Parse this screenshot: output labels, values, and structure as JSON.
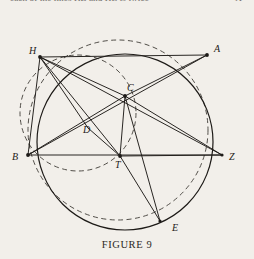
{
  "page": {
    "background_color": "#f2efea",
    "ink_color": "#1d1a17",
    "top_running_text": "each of the lines HZ and HE is twice",
    "top_running_text_right": "A",
    "caption": "FIGURE 9"
  },
  "figure": {
    "name": "figure-9",
    "title": "FIGURE 9",
    "labels": {
      "A": "A",
      "B": "B",
      "C": "C",
      "D": "D",
      "E": "E",
      "H": "H",
      "T": "T",
      "Z": "Z"
    },
    "points": [
      {
        "id": "H",
        "label": "H",
        "x": 40,
        "y": 57,
        "label_x": 29,
        "label_y": 54
      },
      {
        "id": "A",
        "label": "A",
        "x": 207,
        "y": 55,
        "label_x": 214,
        "label_y": 52
      },
      {
        "id": "C",
        "label": "C",
        "x": 125,
        "y": 96,
        "label_x": 127,
        "label_y": 91
      },
      {
        "id": "D",
        "label": "D",
        "x": 88,
        "y": 128,
        "label_x": 85,
        "label_y": 133
      },
      {
        "id": "B",
        "label": "B",
        "x": 28,
        "y": 155,
        "label_x": 14,
        "label_y": 159
      },
      {
        "id": "T",
        "label": "T",
        "x": 120,
        "y": 156,
        "label_x": 114,
        "label_y": 167
      },
      {
        "id": "Z",
        "label": "Z",
        "x": 222,
        "y": 155,
        "label_x": 228,
        "label_y": 159
      },
      {
        "id": "E",
        "label": "E",
        "x": 160,
        "y": 221,
        "label_x": 174,
        "label_y": 230
      }
    ],
    "circles": [
      {
        "id": "main-circle",
        "style": "solid",
        "cx": 125,
        "cy": 142,
        "r": 88
      },
      {
        "id": "dashed-circle-1",
        "style": "dashed",
        "cx": 118,
        "cy": 130,
        "r": 90
      },
      {
        "id": "dashed-circle-2",
        "style": "dashed",
        "cx": 78,
        "cy": 113,
        "r": 58
      }
    ],
    "segments": [
      {
        "from": "H",
        "to": "A",
        "style": "solid"
      },
      {
        "from": "H",
        "to": "B",
        "style": "solid"
      },
      {
        "from": "H",
        "to": "C",
        "style": "solid"
      },
      {
        "from": "H",
        "to": "D",
        "style": "solid"
      },
      {
        "from": "H",
        "to": "T",
        "style": "solid"
      },
      {
        "from": "H",
        "to": "Z",
        "style": "solid"
      },
      {
        "from": "B",
        "to": "Z",
        "style": "solid"
      },
      {
        "from": "B",
        "to": "A",
        "style": "solid"
      },
      {
        "from": "B",
        "to": "C",
        "style": "solid"
      },
      {
        "from": "A",
        "to": "C",
        "style": "solid"
      },
      {
        "from": "C",
        "to": "Z",
        "style": "solid"
      },
      {
        "from": "C",
        "to": "T",
        "style": "solid"
      },
      {
        "from": "C",
        "to": "E",
        "style": "solid"
      },
      {
        "from": "T",
        "to": "Z",
        "style": "solid"
      },
      {
        "from": "T",
        "to": "E",
        "style": "solid"
      },
      {
        "from": "D",
        "to": "T",
        "style": "solid"
      }
    ]
  }
}
